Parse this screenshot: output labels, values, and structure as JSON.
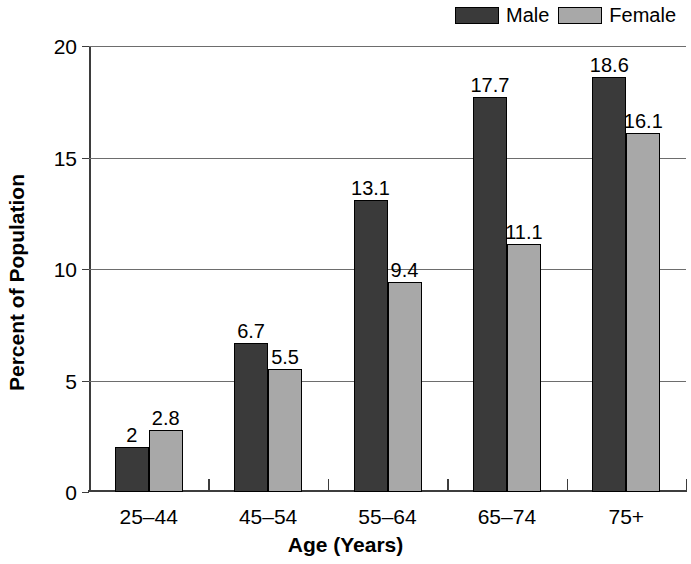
{
  "chart_data": {
    "type": "bar",
    "title": "",
    "subtitle": "",
    "xlabel": "Age (Years)",
    "ylabel": "Percent of Population",
    "categories": [
      "25–44",
      "45–54",
      "55–64",
      "65–74",
      "75+"
    ],
    "series": [
      {
        "name": "Male",
        "color": "#3a3a3a",
        "values": [
          2,
          6.7,
          13.1,
          17.7,
          18.6
        ],
        "labels": [
          "2",
          "6.7",
          "13.1",
          "17.7",
          "18.6"
        ]
      },
      {
        "name": "Female",
        "color": "#a8a8a8",
        "values": [
          2.8,
          5.5,
          9.4,
          11.1,
          16.1
        ],
        "labels": [
          "2.8",
          "5.5",
          "9.4",
          "11.1",
          "16.1"
        ]
      }
    ],
    "ylim": [
      0,
      20
    ],
    "ytick_values": [
      0,
      5,
      10,
      15,
      20
    ],
    "ytick_labels": [
      "0",
      "5",
      "10",
      "15",
      "20"
    ],
    "grid": true,
    "grid_axis": "y",
    "legend_position": "top-right",
    "bar_value_labels": true
  },
  "legend": {
    "entries": [
      {
        "label": "Male",
        "color": "#3a3a3a"
      },
      {
        "label": "Female",
        "color": "#a8a8a8"
      }
    ]
  }
}
